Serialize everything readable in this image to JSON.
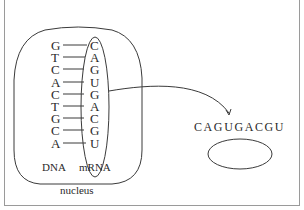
{
  "diagram": {
    "dna_strand": [
      "G",
      "T",
      "C",
      "A",
      "C",
      "T",
      "G",
      "C",
      "A"
    ],
    "mrna_strand": [
      "C",
      "A",
      "G",
      "U",
      "G",
      "A",
      "C",
      "G",
      "U"
    ],
    "labels": {
      "dna": "DNA",
      "mrna": "mRNA",
      "nucleus": "nucleus"
    },
    "cytoplasm_sequence": "CAGUGACGU",
    "colors": {
      "line": "#3a3a3a",
      "text": "#2a2a2a",
      "frame": "#9a9a9a",
      "background": "#ffffff"
    }
  }
}
